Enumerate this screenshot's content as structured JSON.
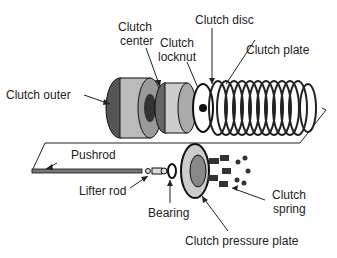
{
  "diagram": {
    "labels": {
      "clutch_outer": "Clutch outer",
      "clutch_center_1": "Clutch",
      "clutch_center_2": "center",
      "clutch_locknut_1": "Clutch",
      "clutch_locknut_2": "locknut",
      "clutch_disc": "Clutch disc",
      "clutch_plate": "Clutch plate",
      "pushrod": "Pushrod",
      "lifter_rod": "Lifter rod",
      "bearing": "Bearing",
      "clutch_spring_1": "Clutch",
      "clutch_spring_2": "spring",
      "clutch_pressure_plate": "Clutch pressure plate"
    }
  }
}
